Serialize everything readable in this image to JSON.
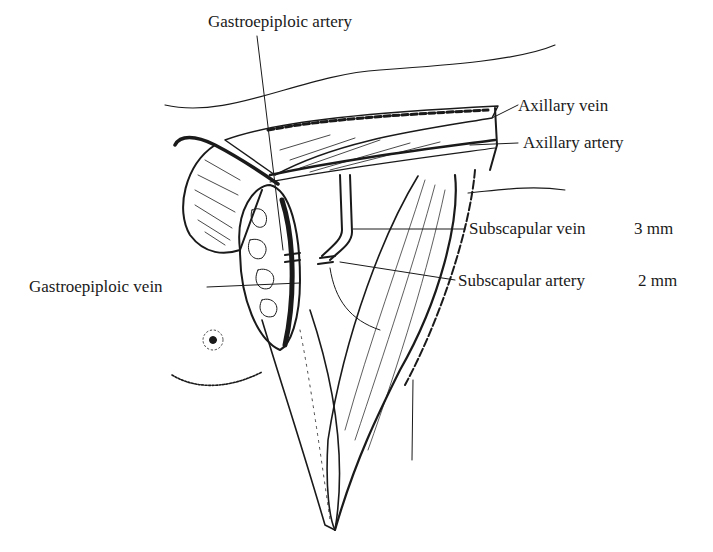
{
  "figure": {
    "type": "surgical line illustration"
  },
  "labels": {
    "gastroepiploic_artery": "Gastroepiploic artery",
    "axillary_vein": "Axillary vein",
    "axillary_artery": "Axillary artery",
    "subscapular_vein": "Subscapular vein",
    "subscapular_vein_size": "3 mm",
    "subscapular_artery": "Subscapular artery",
    "subscapular_artery_size": "2 mm",
    "gastroepiploic_vein": "Gastroepiploic vein"
  },
  "colors": {
    "ink": "#1a1a1a",
    "background": "#ffffff"
  }
}
